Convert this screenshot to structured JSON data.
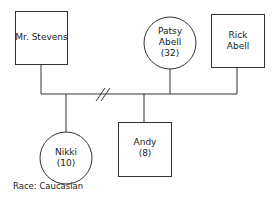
{
  "diagram": {
    "type": "genogram",
    "nodes": [
      {
        "id": "mr-stevens",
        "shape": "square",
        "lines": [
          "Mr. Stevens"
        ]
      },
      {
        "id": "patsy-abell",
        "shape": "circle",
        "lines": [
          "Patsy",
          "Abell",
          "(32)"
        ]
      },
      {
        "id": "rick-abell",
        "shape": "square",
        "lines": [
          "Rick",
          "Abell"
        ]
      },
      {
        "id": "nikki",
        "shape": "circle",
        "lines": [
          "Nikki",
          "(10)"
        ]
      },
      {
        "id": "andy",
        "shape": "square",
        "lines": [
          "Andy",
          "(8)"
        ]
      }
    ],
    "relationships": [
      {
        "from": "mr-stevens",
        "to": "patsy-abell",
        "type": "divorced"
      },
      {
        "from": "patsy-abell",
        "to": "rick-abell",
        "type": "married"
      }
    ],
    "children": [
      "nikki",
      "andy"
    ],
    "footnote": "Race: Caucasian"
  }
}
